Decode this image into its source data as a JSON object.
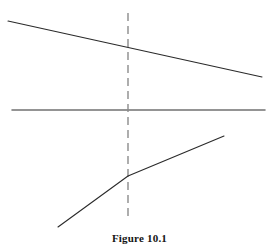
{
  "figure": {
    "caption": "Figure 10.1",
    "background_color": "#ffffff",
    "line_color": "#2a2a2a",
    "dashed_line_color": "#8c8c8c",
    "stroke_width": 1.1,
    "width": 279,
    "height": 251
  },
  "chart_data": {
    "type": "line",
    "title": "Figure 10.1",
    "xlabel": "",
    "ylabel": "",
    "xlim": [
      0,
      279
    ],
    "ylim": [
      251,
      0
    ],
    "grid": false,
    "legend": "none",
    "axes": {
      "horizontal_axis": {
        "name": "horizontal-axis",
        "x": [
          12,
          265
        ],
        "y": [
          110,
          110
        ],
        "style": "solid"
      },
      "vertical_reference": {
        "name": "vertical-dashed-reference-line",
        "x": [
          128,
          128
        ],
        "y": [
          13,
          218
        ],
        "style": "dashed",
        "dash_pattern": [
          8,
          5
        ]
      }
    },
    "series": [
      {
        "name": "upper-downward-sloping-line",
        "style": "solid",
        "points": [
          {
            "x": 8,
            "y": 21
          },
          {
            "x": 262,
            "y": 77
          }
        ]
      },
      {
        "name": "lower-kinked-rising-line",
        "style": "solid",
        "points": [
          {
            "x": 58,
            "y": 227
          },
          {
            "x": 128,
            "y": 176
          },
          {
            "x": 224,
            "y": 136
          }
        ]
      }
    ],
    "annotations": [
      {
        "name": "intersection-upper-line-with-reference",
        "x": 128,
        "y": 47
      },
      {
        "name": "kink-point-lower-line",
        "x": 128,
        "y": 176
      }
    ]
  }
}
